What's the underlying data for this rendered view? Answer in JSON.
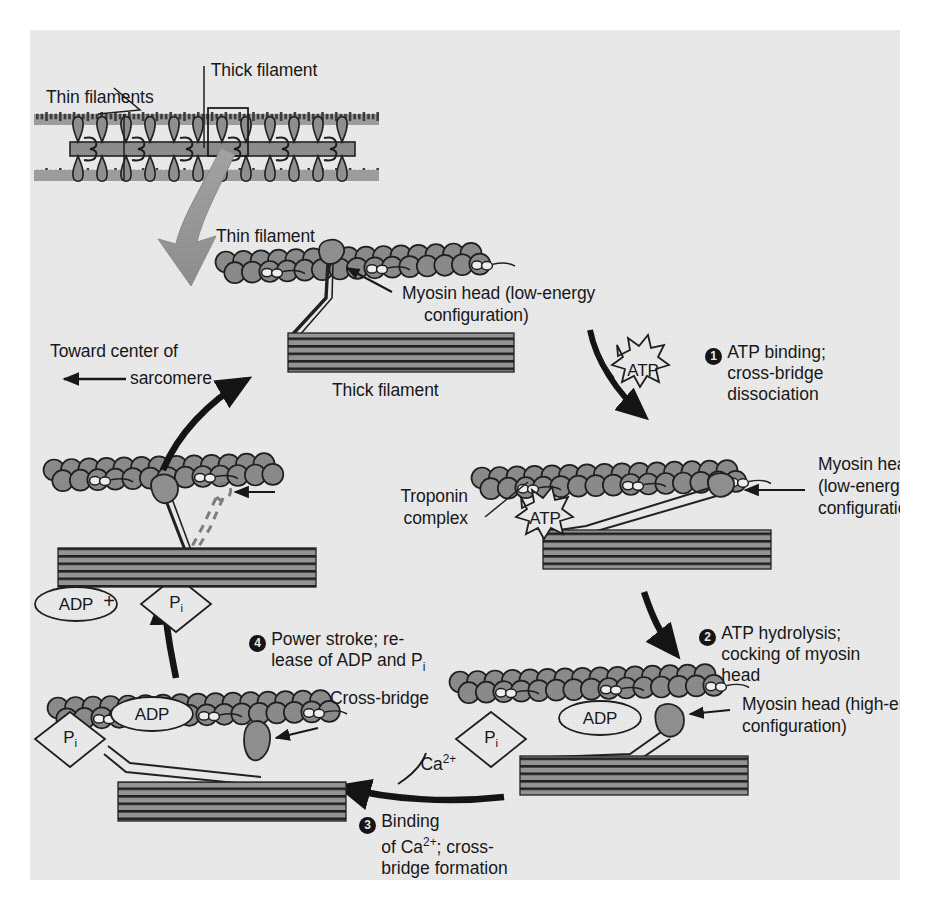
{
  "figure": {
    "type": "biology-process-diagram"
  },
  "colors": {
    "page_background": "#ececed",
    "bead_fill": "#8a8a8a",
    "bead_outline": "#1b1b1b",
    "thick_filament_fill": "#8f8f8f",
    "thick_filament_stripe": "#1b1b1b",
    "myosin_fill": "#8f8f8f",
    "arrow_black": "#101010",
    "big_arrow_gray": "#9a9a9a",
    "text": "#141414"
  },
  "labels": {
    "thick_filament_top": "Thick filament",
    "thin_filaments_top": "Thin filaments",
    "thin_filament": "Thin filament",
    "myosin_head_low_1": "Myosin head (low-energy",
    "myosin_head_low_1b": "configuration)",
    "thick_filament": "Thick filament",
    "toward_center_1": "Toward center of",
    "toward_center_2": "sarcomere",
    "troponin_1": "Troponin",
    "troponin_2": "complex",
    "myosin_head_low_2a": "Myosin head",
    "myosin_head_low_2b": "(low-energy",
    "myosin_head_low_2c": "configuration)",
    "myosin_head_high_a": "Myosin head (high-energy",
    "myosin_head_high_b": "configuration)",
    "cross_bridge": "Cross-bridge",
    "calcium": "Ca2+",
    "calcium_html": "Ca<sup>2+</sup>",
    "atp_burst_1": "ATP",
    "atp_burst_2": "ATP",
    "adp_ellipse_free": "ADP",
    "adp_ellipse_bound_left": "ADP",
    "adp_ellipse_bound_right": "ADP",
    "pi_diamond_free": "Pi",
    "pi_diamond_left": "Pi",
    "pi_diamond_right": "Pi",
    "plus_sign": "+"
  },
  "steps": [
    {
      "number": "1",
      "lines": [
        "ATP binding;",
        "cross-bridge",
        "dissociation"
      ]
    },
    {
      "number": "2",
      "lines": [
        "ATP hydrolysis;",
        "cocking of myosin",
        "head"
      ]
    },
    {
      "number": "3",
      "lines": [
        "Binding",
        "of Ca2+; cross-",
        "bridge formation"
      ],
      "lines_html": [
        "Binding",
        "of Ca<sup>2+</sup>; cross-",
        "bridge formation"
      ]
    },
    {
      "number": "4",
      "lines": [
        "Power stroke; re-",
        "lease of ADP and Pi"
      ],
      "lines_html": [
        "Power stroke; re-",
        "lease of ADP and P<sub>i</sub>"
      ]
    }
  ]
}
